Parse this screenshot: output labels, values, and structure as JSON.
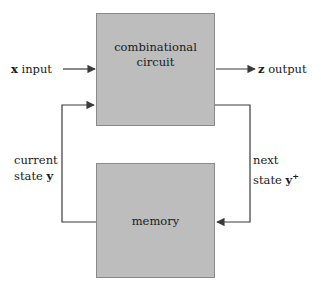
{
  "diagram": {
    "background_color": "#ffffff",
    "block_fill_color": "#bdbdbd",
    "block_border_color": "#8a8a8a",
    "wire_color": "#3a3a3a",
    "text_color": "#1a1a1a",
    "blocks": [
      {
        "id": "combinational-circuit",
        "line1": "combinational",
        "line2": "circuit"
      },
      {
        "id": "memory",
        "line1": "memory"
      }
    ],
    "labels": {
      "x_input_symbol": "x",
      "x_input_text": " input",
      "z_output_symbol": "z",
      "z_output_text": " output",
      "current_state_line1": "current",
      "current_state_line2_text": "state ",
      "current_state_symbol": "y",
      "next_state_line1": "next",
      "next_state_line2_text": "state ",
      "next_state_symbol": "y",
      "next_state_superscript": "+"
    }
  }
}
